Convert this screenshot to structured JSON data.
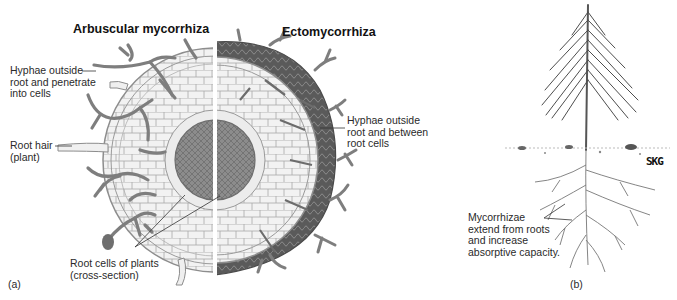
{
  "figure": {
    "panel_a": {
      "label": "(a)",
      "titles": {
        "left": "Arbuscular mycorrhiza",
        "right": "Ectomycorrhiza"
      },
      "callouts": [
        {
          "id": "hyphae-penetrate",
          "text": "Hyphae outside\nroot and penetrate\ninto cells"
        },
        {
          "id": "root-hair",
          "text": "Root hair\n(plant)"
        },
        {
          "id": "root-cells",
          "text": "Root cells of plants\n(cross-section)"
        },
        {
          "id": "hyphae-between",
          "text": "Hyphae outside\nroot and between\nroot cells"
        }
      ]
    },
    "panel_b": {
      "label": "(b)",
      "callout": "Mycorrhizae\nextend from roots\nand increase\nabsorptive capacity.",
      "watermark": "SKG"
    },
    "colors": {
      "hyphae": "#7d7d7d",
      "mantle": "#5e5e5e",
      "cell_fill": "#f1f1f1",
      "cell_stroke": "#9a9a9a",
      "stele": "#8a8a8a",
      "text": "#222222"
    }
  }
}
